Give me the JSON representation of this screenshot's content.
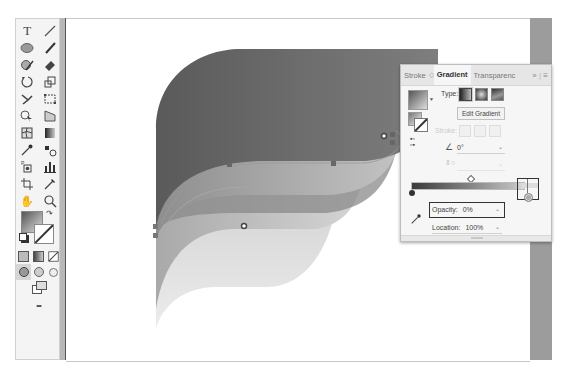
{
  "toolbar": {
    "tools": [
      [
        "type-tool",
        "line-segment-tool"
      ],
      [
        "ellipse-tool",
        "paintbrush-tool"
      ],
      [
        "shaper-tool",
        "eraser-tool"
      ],
      [
        "rotate-tool",
        "scale-tool"
      ],
      [
        "warp-tool",
        "free-transform-tool"
      ],
      [
        "shape-builder-tool",
        "perspective-grid-tool"
      ],
      [
        "mesh-tool",
        "gradient-tool"
      ],
      [
        "eyedropper-tool",
        "blend-tool"
      ],
      [
        "symbol-sprayer-tool",
        "column-graph-tool"
      ],
      [
        "artboard-tool",
        "slice-tool"
      ],
      [
        "hand-tool",
        "zoom-tool"
      ]
    ],
    "glyphs": {
      "type": "T",
      "hand": "✋",
      "zoom": "⚲",
      "more": "•••"
    }
  },
  "panel": {
    "tabs": [
      {
        "label": "Stroke",
        "active": false
      },
      {
        "label": "Gradient",
        "active": true
      },
      {
        "label": "Transparenc",
        "active": false
      }
    ],
    "tab_separator": "◇",
    "overflow": "»",
    "menu": "≡",
    "type_label": "Type:",
    "edit_gradient": "Edit Gradient",
    "stroke_label": "Stroke:",
    "angle_value": "0°",
    "aspect_value": "",
    "opacity_label": "Opacity:",
    "opacity_value": "0%",
    "location_label": "Location:",
    "location_value": "100%",
    "gradient_colors": {
      "start": "#3a3a3a",
      "end": "#e0e0e0"
    }
  },
  "canvas": {
    "background": "#ffffff",
    "gutter_color": "#9c9c9c"
  }
}
